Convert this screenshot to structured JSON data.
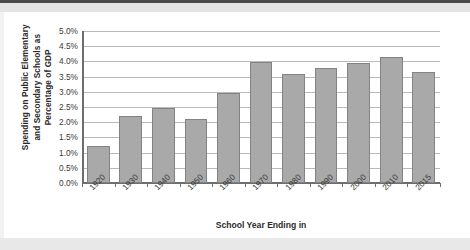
{
  "chart_data": {
    "type": "bar",
    "title": "",
    "xlabel": "School Year Ending in",
    "ylabel": "Spending on Public Elementary and Secondary Schools as Percentage of GDP",
    "ylabel_lines": [
      "Spending on Public Elementary",
      "and Secondary Schools as",
      "Percentage of GDP"
    ],
    "categories": [
      "1920",
      "1930",
      "1940",
      "1950",
      "1960",
      "1970",
      "1980",
      "1990",
      "2000",
      "2010",
      "2015"
    ],
    "values": [
      1.22,
      2.22,
      2.48,
      2.12,
      2.97,
      3.97,
      3.57,
      3.77,
      3.95,
      4.15,
      3.65
    ],
    "value_labels": [
      "1.22%",
      "2.22%",
      "2.48%",
      "2.12%",
      "2.97%",
      "3.97%",
      "3.57%",
      "3.77%",
      "3.95%",
      "4.15%",
      "3.65%"
    ],
    "ylim": [
      0,
      5
    ],
    "ytick_values": [
      0,
      0.5,
      1,
      1.5,
      2,
      2.5,
      3,
      3.5,
      4,
      4.5,
      5
    ],
    "ytick_labels": [
      "0.0%",
      "0.5%",
      "1.0%",
      "1.5%",
      "2.0%",
      "2.5%",
      "3.0%",
      "3.5%",
      "4.0%",
      "4.5%",
      "5.0%"
    ],
    "grid": true,
    "legend": false,
    "bar_color": "#a9a9a9",
    "bar_border_color": "#838383",
    "gridline_color": "#b9b9b9",
    "axis_color": "#6e6e6e",
    "background": "#ffffff"
  }
}
